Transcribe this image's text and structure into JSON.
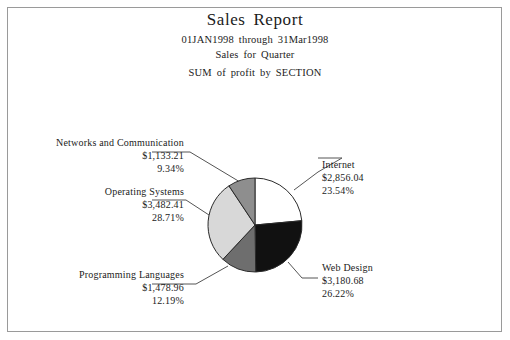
{
  "report": {
    "title": "Sales Report",
    "subtitle_1": "01JAN1998 through 31Mar1998",
    "subtitle_2": "Sales for Quarter",
    "subtitle_3": "SUM of profit by SECTION"
  },
  "chart_data": {
    "type": "pie",
    "title": "Sales Report",
    "subtitle": "01JAN1998 through 31Mar1998 / Sales for Quarter / SUM of profit by SECTION",
    "value_prefix": "$",
    "categories": [
      "Internet",
      "Web Design",
      "Programming Languages",
      "Operating Systems",
      "Networks and Communication"
    ],
    "values": [
      2856.04,
      3180.68,
      1478.96,
      3482.41,
      1133.21
    ],
    "percents": [
      23.54,
      26.22,
      12.19,
      28.71,
      9.34
    ],
    "value_labels": [
      "$2,856.04",
      "$3,180.68",
      "$1,478.96",
      "$3,482.41",
      "$1,133.21"
    ],
    "percent_labels": [
      "23.54%",
      "26.22%",
      "12.19%",
      "28.71%",
      "9.34%"
    ],
    "slice_colors": [
      "#ffffff",
      "#111111",
      "#6e6e6e",
      "#d8d8d8",
      "#8e8e8e"
    ],
    "start_angle_deg": 0,
    "direction": "clockwise",
    "legend": "none",
    "grid": false,
    "total": 12131.3
  },
  "slices": {
    "internet": {
      "name": "Internet",
      "value": "$2,856.04",
      "pct": "23.54%"
    },
    "web": {
      "name": "Web Design",
      "value": "$3,180.68",
      "pct": "26.22%"
    },
    "prog": {
      "name": "Programming Languages",
      "value": "$1,478.96",
      "pct": "12.19%"
    },
    "os": {
      "name": "Operating Systems",
      "value": "$3,482.41",
      "pct": "28.71%"
    },
    "networks": {
      "name": "Networks and Communication",
      "value": "$1,133.21",
      "pct": "9.34%"
    }
  }
}
